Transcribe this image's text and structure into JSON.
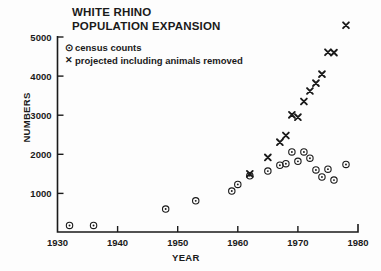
{
  "chart_data": {
    "type": "scatter",
    "title": "WHITE RHINO POPULATION EXPANSION",
    "title_line1": "WHITE RHINO",
    "title_line2": "POPULATION EXPANSION",
    "xlabel": "YEAR",
    "ylabel": "NUMBERS",
    "xlim": [
      1930,
      1980
    ],
    "ylim": [
      0,
      5400
    ],
    "xticks": [
      1930,
      1940,
      1950,
      1960,
      1970,
      1980
    ],
    "xtick_labels": [
      "1930",
      "1940",
      "1950",
      "1960",
      "1970",
      "1980"
    ],
    "yticks": [
      1000,
      2000,
      3000,
      4000,
      5000
    ],
    "ytick_labels": [
      "1000",
      "2000",
      "3000",
      "4000",
      "5000"
    ],
    "grid": false,
    "legend_position": "upper-left-inside",
    "series": [
      {
        "name": "census counts",
        "marker": "circle-dot",
        "points": [
          {
            "x": 1932,
            "y": 180
          },
          {
            "x": 1936,
            "y": 180
          },
          {
            "x": 1948,
            "y": 600
          },
          {
            "x": 1953,
            "y": 810
          },
          {
            "x": 1959,
            "y": 1060
          },
          {
            "x": 1960,
            "y": 1230
          },
          {
            "x": 1962,
            "y": 1450
          },
          {
            "x": 1965,
            "y": 1570
          },
          {
            "x": 1967,
            "y": 1720
          },
          {
            "x": 1968,
            "y": 1760
          },
          {
            "x": 1969,
            "y": 2060
          },
          {
            "x": 1970,
            "y": 1820
          },
          {
            "x": 1971,
            "y": 2060
          },
          {
            "x": 1972,
            "y": 1900
          },
          {
            "x": 1973,
            "y": 1600
          },
          {
            "x": 1974,
            "y": 1420
          },
          {
            "x": 1975,
            "y": 1620
          },
          {
            "x": 1976,
            "y": 1340
          },
          {
            "x": 1978,
            "y": 1740
          }
        ]
      },
      {
        "name": "projected including animals removed",
        "marker": "x",
        "points": [
          {
            "x": 1962,
            "y": 1500
          },
          {
            "x": 1965,
            "y": 1920
          },
          {
            "x": 1967,
            "y": 2310
          },
          {
            "x": 1968,
            "y": 2480
          },
          {
            "x": 1969,
            "y": 3010
          },
          {
            "x": 1970,
            "y": 2950
          },
          {
            "x": 1971,
            "y": 3350
          },
          {
            "x": 1972,
            "y": 3620
          },
          {
            "x": 1973,
            "y": 3820
          },
          {
            "x": 1974,
            "y": 4050
          },
          {
            "x": 1975,
            "y": 4610
          },
          {
            "x": 1976,
            "y": 4600
          },
          {
            "x": 1978,
            "y": 5300
          }
        ]
      }
    ]
  },
  "legend": {
    "census_marker": "⊙",
    "census_label": "census counts",
    "projected_marker": "✕",
    "projected_label": "projected including animals removed"
  },
  "colors": {
    "ink": "#1a1a1a",
    "background": "#fdfdfd"
  }
}
